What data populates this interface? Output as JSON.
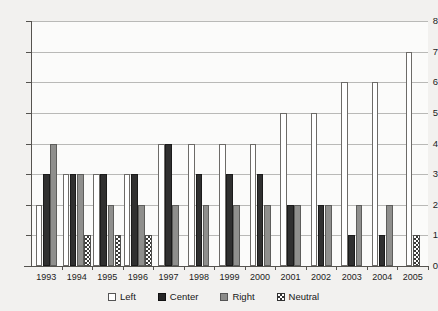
{
  "chart_data": {
    "type": "bar",
    "title": "",
    "xlabel": "",
    "ylabel": "",
    "ylim": [
      0,
      8
    ],
    "ytick_labels": [
      "0",
      "1",
      "2",
      "3",
      "4",
      "5",
      "6",
      "7",
      "8"
    ],
    "grid": true,
    "legend_position": "bottom-center",
    "categories": [
      "1993",
      "1994",
      "1995",
      "1996",
      "1997",
      "1998",
      "1999",
      "2000",
      "2001",
      "2002",
      "2003",
      "2004",
      "2005"
    ],
    "series": [
      {
        "name": "Left",
        "color": "#ffffff",
        "values": [
          2,
          3,
          3,
          3,
          4,
          4,
          4,
          4,
          5,
          5,
          6,
          6,
          7
        ]
      },
      {
        "name": "Center",
        "color": "#303030",
        "values": [
          3,
          3,
          3,
          3,
          4,
          3,
          3,
          3,
          2,
          2,
          1,
          1,
          0
        ]
      },
      {
        "name": "Right",
        "color": "#8f8f8d",
        "values": [
          4,
          3,
          2,
          2,
          2,
          2,
          2,
          2,
          2,
          2,
          2,
          2,
          0
        ]
      },
      {
        "name": "Neutral",
        "color": "#3a3a38",
        "values": [
          0,
          1,
          1,
          1,
          0,
          0,
          0,
          0,
          0,
          0,
          0,
          0,
          1
        ]
      }
    ]
  },
  "legend": {
    "items": [
      {
        "label": "Left"
      },
      {
        "label": "Center"
      },
      {
        "label": "Right"
      },
      {
        "label": "Neutral"
      }
    ]
  }
}
